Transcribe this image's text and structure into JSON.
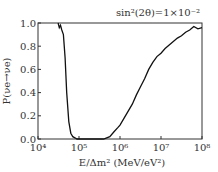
{
  "chart_data": {
    "type": "line",
    "title": "",
    "annotation": "sin²(2θ)=1×10⁻²",
    "xlabel": "E/Δm² (MeV/eV²)",
    "ylabel": "P(νe→νe)",
    "xscale": "log",
    "xlim": [
      10000,
      100000000
    ],
    "ylim": [
      0,
      1
    ],
    "xticks": [
      "10⁴",
      "10⁵",
      "10⁶",
      "10⁷",
      "10⁸"
    ],
    "yticks": [
      "0.0",
      "0.2",
      "0.4",
      "0.6",
      "0.8",
      "1.0"
    ],
    "grid": false,
    "series": [
      {
        "name": "survival probability",
        "log10_x": [
          4.49,
          4.52,
          4.55,
          4.58,
          4.62,
          4.66,
          4.7,
          4.75,
          4.8,
          4.85,
          4.9,
          4.95,
          5.0,
          5.2,
          5.4,
          5.6,
          5.75,
          5.85,
          5.95,
          6.0,
          6.1,
          6.2,
          6.3,
          6.4,
          6.5,
          6.6,
          6.7,
          6.8,
          6.9,
          7.0,
          7.1,
          7.2,
          7.3,
          7.4,
          7.5,
          7.6,
          7.7,
          7.8,
          7.9,
          8.0
        ],
        "values": [
          1.0,
          0.96,
          0.98,
          0.94,
          0.9,
          0.7,
          0.4,
          0.15,
          0.05,
          0.02,
          0.01,
          0.0,
          0.0,
          0.0,
          0.0,
          0.0,
          0.02,
          0.06,
          0.1,
          0.12,
          0.18,
          0.24,
          0.3,
          0.38,
          0.45,
          0.52,
          0.6,
          0.66,
          0.71,
          0.74,
          0.78,
          0.81,
          0.84,
          0.87,
          0.89,
          0.92,
          0.94,
          0.97,
          0.95,
          0.96
        ]
      }
    ]
  }
}
